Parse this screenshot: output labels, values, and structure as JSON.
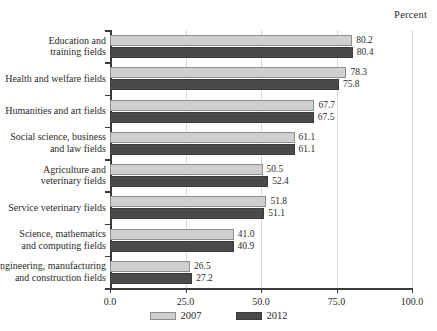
{
  "axis_title": "Percent",
  "legend": {
    "position": "bottom-center",
    "entries": [
      {
        "label": "2007",
        "color": "#cfcfcf"
      },
      {
        "label": "2012",
        "color": "#4a4a4a"
      }
    ]
  },
  "chart_data": {
    "type": "bar",
    "orientation": "horizontal",
    "title": "",
    "subtitle": "",
    "xlabel": "Percent",
    "ylabel": "",
    "xlim": [
      0.0,
      100.0
    ],
    "xticks": [
      "0.0",
      "25.0",
      "50.0",
      "75.0",
      "100.0"
    ],
    "xtick_values": [
      0.0,
      25.0,
      50.0,
      75.0,
      100.0
    ],
    "grid": true,
    "grid_axis": "x",
    "legend_position": "bottom-center",
    "categories": [
      "Education and training fields",
      "Health and welfare fields",
      "Humanities and art fields",
      "Social science, business and law fields",
      "Agriculture and veterinary fields",
      "Service veterinary fields",
      "Science, mathematics and computing fields",
      "Engineering, manufacturing and construction fields"
    ],
    "category_lines": [
      [
        "Education and",
        "training fields"
      ],
      [
        "Health and welfare fields"
      ],
      [
        "Humanities and art fields"
      ],
      [
        "Social science, business",
        "and law fields"
      ],
      [
        "Agriculture and",
        "veterinary fields"
      ],
      [
        "Service veterinary fields"
      ],
      [
        "Science, mathematics",
        "and computing fields"
      ],
      [
        "Engineering, manufacturing",
        "and construction fields"
      ]
    ],
    "series": [
      {
        "name": "2007",
        "color": "#cfcfcf",
        "values": [
          80.2,
          78.3,
          67.7,
          61.1,
          50.5,
          51.8,
          41.0,
          26.5
        ],
        "labels": [
          "80.2",
          "78.3",
          "67.7",
          "61.1",
          "50.5",
          "51.8",
          "41.0",
          "26.5"
        ]
      },
      {
        "name": "2012",
        "color": "#4a4a4a",
        "values": [
          80.4,
          75.8,
          67.5,
          61.1,
          52.4,
          51.1,
          40.9,
          27.2
        ],
        "labels": [
          "80.4",
          "75.8",
          "67.5",
          "61.1",
          "52.4",
          "51.1",
          "40.9",
          "27.2"
        ]
      }
    ]
  }
}
